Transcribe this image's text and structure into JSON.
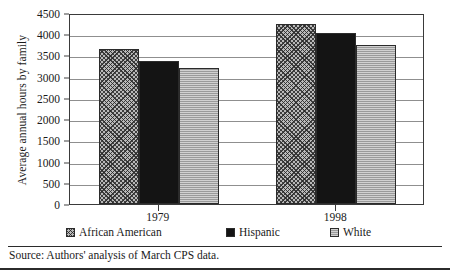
{
  "chart_data": {
    "type": "bar",
    "title": "",
    "xlabel": "",
    "ylabel": "Average annual hours by family",
    "categories": [
      "1979",
      "1998"
    ],
    "series": [
      {
        "name": "African American",
        "values": [
          3650,
          4250
        ],
        "color": "#b9b9b9",
        "pattern": "crosshatch"
      },
      {
        "name": "Hispanic",
        "values": [
          3380,
          4020
        ],
        "color": "#141414",
        "pattern": "solid"
      },
      {
        "name": "White",
        "values": [
          3200,
          3750
        ],
        "color": "#9a9a9a",
        "pattern": "horizontal-lines"
      }
    ],
    "ylim": [
      0,
      4500
    ],
    "ytick_step": 500,
    "yticks": [
      0,
      500,
      1000,
      1500,
      2000,
      2500,
      3000,
      3500,
      4000,
      4500
    ],
    "ytick_labels": [
      "0",
      "500",
      "1000",
      "1500",
      "2000",
      "2500",
      "3000",
      "3500",
      "4000",
      "4500"
    ],
    "grid": true,
    "grid_axis": "y",
    "legend_position": "bottom"
  },
  "axis": {
    "y_title": "Average annual hours by family"
  },
  "legend": {
    "items": [
      {
        "label": "African American"
      },
      {
        "label": "Hispanic"
      },
      {
        "label": "White"
      }
    ]
  },
  "source": {
    "note": "Source: Authors' analysis of March CPS data."
  }
}
